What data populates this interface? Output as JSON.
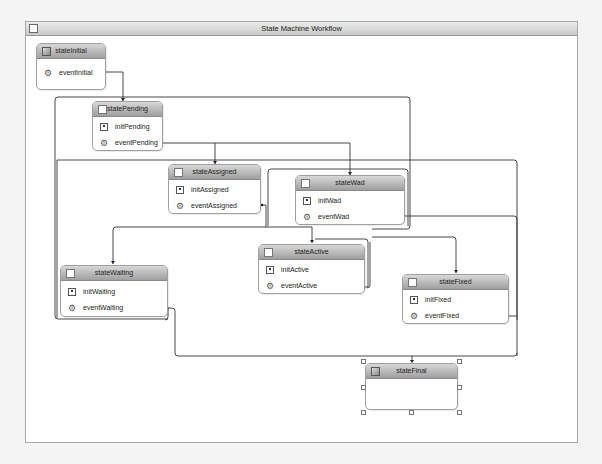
{
  "workflow": {
    "title": "State Machine Workflow"
  },
  "states": {
    "stateInitial": {
      "title": "stateInitial",
      "event": "eventInitial"
    },
    "statePending": {
      "title": "statePending",
      "init": "initPending",
      "event": "eventPending"
    },
    "stateAssigned": {
      "title": "stateAssigned",
      "init": "initAssigned",
      "event": "eventAssigned"
    },
    "stateWad": {
      "title": "stateWad",
      "init": "initWad",
      "event": "eventWad"
    },
    "stateActive": {
      "title": "stateActive",
      "init": "initActive",
      "event": "eventActive"
    },
    "stateWaiting": {
      "title": "stateWaiting",
      "init": "initWaiting",
      "event": "eventWaiting"
    },
    "stateFixed": {
      "title": "stateFixed",
      "init": "initFixed",
      "event": "eventFixed"
    },
    "stateFinal": {
      "title": "stateFinal",
      "selected": true
    }
  },
  "icons": {
    "state_header": "checkbox-square-icon",
    "initial_state_header": "initial-state-icon",
    "completed_state_header": "completed-state-icon",
    "init_activity": "state-initialization-icon",
    "event_activity": "event-driven-icon"
  },
  "colors": {
    "header_gradient_top": "#d8d8d8",
    "header_gradient_bottom": "#9f9f9f",
    "connector": "#333333",
    "canvas": "#ffffff",
    "frame_border": "#a8a8a8"
  },
  "transitions": [
    {
      "from": "eventInitial",
      "to": "statePending"
    },
    {
      "from": "eventPending",
      "to": "stateAssigned"
    },
    {
      "from": "eventPending",
      "to": "stateWad"
    },
    {
      "from": "eventAssigned",
      "to": "stateActive"
    },
    {
      "from": "eventAssigned",
      "to": "stateWaiting"
    },
    {
      "from": "eventWad",
      "to": "stateFixed"
    },
    {
      "from": "eventWad",
      "to": "stateFinal"
    },
    {
      "from": "eventActive",
      "to": "stateActive"
    },
    {
      "from": "eventWaiting",
      "to": "stateFinal"
    },
    {
      "from": "eventFixed",
      "to": "stateFinal"
    }
  ]
}
